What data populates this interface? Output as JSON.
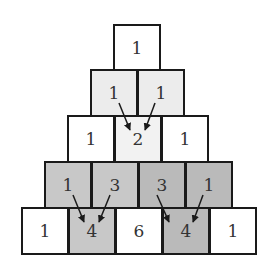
{
  "colors": {
    "white": "#ffffff",
    "light": "#ececec",
    "lighter": "#f2f2f2",
    "mid": "#c8c8c8",
    "dark": "#bababa",
    "border": "#1a1a1a"
  },
  "rows": [
    {
      "y": 24,
      "cells": [
        {
          "x": 113,
          "value": "1",
          "fill": "#ffffff"
        }
      ]
    },
    {
      "y": 69,
      "cells": [
        {
          "x": 90,
          "value": "1",
          "fill": "#ececec"
        },
        {
          "x": 137,
          "value": "1",
          "fill": "#ececec"
        }
      ]
    },
    {
      "y": 115,
      "cells": [
        {
          "x": 67,
          "value": "1",
          "fill": "#ffffff"
        },
        {
          "x": 114,
          "value": "2",
          "fill": "#f2f2f2"
        },
        {
          "x": 161,
          "value": "1",
          "fill": "#ffffff"
        }
      ]
    },
    {
      "y": 161,
      "cells": [
        {
          "x": 44,
          "value": "1",
          "fill": "#c8c8c8"
        },
        {
          "x": 91,
          "value": "3",
          "fill": "#c8c8c8"
        },
        {
          "x": 138,
          "value": "3",
          "fill": "#bababa"
        },
        {
          "x": 185,
          "value": "1",
          "fill": "#bababa"
        }
      ]
    },
    {
      "y": 207,
      "cells": [
        {
          "x": 21,
          "value": "1",
          "fill": "#ffffff"
        },
        {
          "x": 68,
          "value": "4",
          "fill": "#c8c8c8"
        },
        {
          "x": 115,
          "value": "6",
          "fill": "#ffffff"
        },
        {
          "x": 162,
          "value": "4",
          "fill": "#bababa"
        },
        {
          "x": 209,
          "value": "1",
          "fill": "#ffffff"
        }
      ]
    }
  ],
  "arrows": [
    [
      119,
      103,
      130,
      130
    ],
    [
      155,
      103,
      145,
      130
    ],
    [
      73,
      195,
      84,
      222
    ],
    [
      110,
      195,
      99,
      222
    ],
    [
      157,
      195,
      169,
      222
    ],
    [
      203,
      195,
      193,
      222
    ]
  ]
}
